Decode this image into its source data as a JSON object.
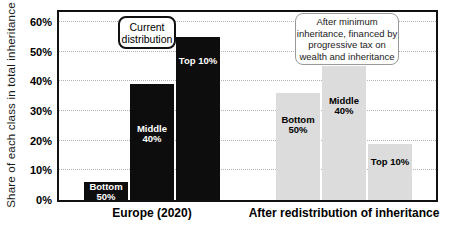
{
  "chart_data": {
    "type": "bar",
    "title": "",
    "ylabel": "Share of each class in total inheritance",
    "xlabel": "",
    "ylim": [
      0,
      63
    ],
    "units": "percent",
    "grid": "horizontal-dotted",
    "legend": "none",
    "yticks": [
      {
        "value": 0,
        "label": "0%"
      },
      {
        "value": 10,
        "label": "10%"
      },
      {
        "value": 20,
        "label": "20%"
      },
      {
        "value": 30,
        "label": "30%"
      },
      {
        "value": 40,
        "label": "40%"
      },
      {
        "value": 50,
        "label": "50%"
      },
      {
        "value": 60,
        "label": "60%"
      }
    ],
    "categories": [
      "Bottom 50%",
      "Middle 40%",
      "Top 10%"
    ],
    "groups": [
      {
        "label": "Europe (2020)",
        "bar_color": "#0d0d0d",
        "bar_label_color": "#ffffff",
        "bars": [
          {
            "name": "Bottom 50%",
            "label_lines": [
              "Bottom",
              "50%"
            ],
            "value": 6
          },
          {
            "name": "Middle 40%",
            "label_lines": [
              "Middle",
              "40%"
            ],
            "value": 39
          },
          {
            "name": "Top 10%",
            "label_lines": [
              "Top 10%"
            ],
            "value": 55
          }
        ]
      },
      {
        "label": "After redistribution of inheritance",
        "bar_color": "#dcdcdc",
        "bar_label_color": "#000000",
        "bars": [
          {
            "name": "Bottom 50%",
            "label_lines": [
              "Bottom",
              "50%"
            ],
            "value": 36
          },
          {
            "name": "Middle 40%",
            "label_lines": [
              "Middle",
              "40%"
            ],
            "value": 45
          },
          {
            "name": "Top 10%",
            "label_lines": [
              "Top 10%"
            ],
            "value": 19
          }
        ]
      }
    ],
    "annotations": [
      {
        "id": "current-distribution",
        "lines": [
          "Current",
          "distribution"
        ],
        "border_style": "thick-black-rounded"
      },
      {
        "id": "after-minimum",
        "lines": [
          "After minimum",
          "inheritance, financed by",
          "progressive tax on",
          "wealth and inheritance"
        ],
        "border_style": "thin-gray-rounded"
      }
    ],
    "colors": {
      "europe_bars": "#0d0d0d",
      "redistribution_bars": "#dcdcdc",
      "frame": "#111111",
      "gridline": "#b3b3b3"
    }
  }
}
